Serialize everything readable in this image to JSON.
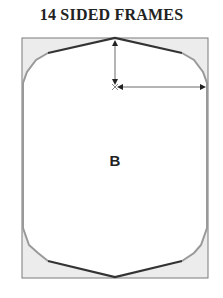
{
  "title": "14 SIDED FRAMES",
  "center_label": "B",
  "colors": {
    "frame_outline": "#7a7a7a",
    "corner_fill": "#ececec",
    "top_bottom_edges": "#333333",
    "side_edges": "#999999",
    "dimension_lines": "#444444"
  },
  "dimensions": [
    {
      "name": "vertical-dimension",
      "direction": "vertical"
    },
    {
      "name": "horizontal-dimension",
      "direction": "horizontal"
    }
  ]
}
